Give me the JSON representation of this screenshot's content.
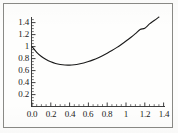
{
  "figure": {
    "background_color": "#fefefd",
    "frame_color": "#8a8a86",
    "axis_color": "#2a2a2a",
    "curve_color": "#1a1a1a"
  },
  "chart_data": {
    "type": "line",
    "title": "",
    "subtitle": "",
    "xlabel": "",
    "ylabel": "",
    "xlim": [
      0.0,
      1.5
    ],
    "ylim": [
      0.0,
      1.5
    ],
    "grid": false,
    "legend": null,
    "legend_position": "none",
    "axis_style": "two-axis-spines-with-ticks",
    "x_ticks": [
      {
        "value": 0.0,
        "label": "0.0"
      },
      {
        "value": 0.2,
        "label": "0.2"
      },
      {
        "value": 0.4,
        "label": "0.4"
      },
      {
        "value": 0.6,
        "label": "0.6"
      },
      {
        "value": 0.8,
        "label": "0.8"
      },
      {
        "value": 1.0,
        "label": "1"
      },
      {
        "value": 1.2,
        "label": "1.2"
      },
      {
        "value": 1.4,
        "label": "1.4"
      }
    ],
    "y_ticks": [
      {
        "value": 0.2,
        "label": "0.2"
      },
      {
        "value": 0.4,
        "label": "0.4"
      },
      {
        "value": 0.6,
        "label": "0.6"
      },
      {
        "value": 0.8,
        "label": "0.8"
      },
      {
        "value": 1.0,
        "label": "1"
      },
      {
        "value": 1.2,
        "label": "1.2"
      },
      {
        "value": 1.4,
        "label": "1.4"
      }
    ],
    "x_minor_tick_count": 4,
    "y_minor_tick_count": 4,
    "series": [
      {
        "name": "curve",
        "color": "#1a1a1a",
        "line_width": 1.1,
        "minimum": {
          "x": 0.37,
          "y": 0.69
        },
        "x": [
          0.0,
          0.05,
          0.1,
          0.15,
          0.2,
          0.25,
          0.3,
          0.35,
          0.4,
          0.45,
          0.5,
          0.55,
          0.6,
          0.65,
          0.7,
          0.75,
          0.8,
          0.85,
          0.9,
          0.95,
          1.0,
          1.05,
          1.1,
          1.15,
          1.2,
          1.25,
          1.3,
          1.35
        ],
        "y": [
          1.0,
          0.905,
          0.835,
          0.783,
          0.745,
          0.718,
          0.701,
          0.692,
          0.691,
          0.697,
          0.709,
          0.727,
          0.75,
          0.778,
          0.81,
          0.847,
          0.888,
          0.933,
          0.982,
          1.035,
          1.092,
          1.152,
          1.216,
          1.284,
          1.306,
          1.378,
          1.434,
          1.493
        ]
      }
    ]
  }
}
